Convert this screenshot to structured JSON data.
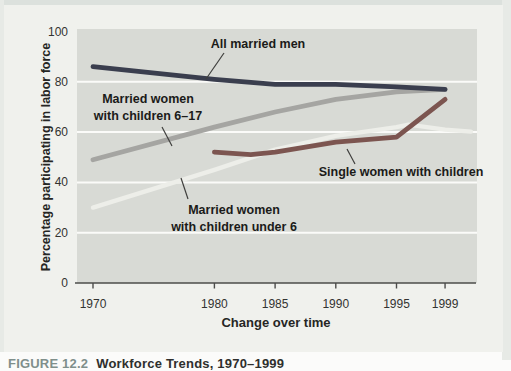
{
  "figure": {
    "caption_label": "FIGURE 12.2",
    "caption_title": "Workforce Trends, 1970–1999"
  },
  "colors": {
    "page": "#fbfbfa",
    "top_strip": "#dce1dd",
    "side_strip": "#e7eae6",
    "panel": "#f0f1ed",
    "plot_bg": "#d8dad5",
    "gridline": "#fbfbf9",
    "axis": "#4c4c4a",
    "tick_text": "#333331",
    "axis_title_text": "#262624",
    "annotation_text": "#1b1b19",
    "leader_line": "#3f3f3d",
    "caption_label": "#7f8f8b",
    "caption_title": "#2f2f2d"
  },
  "chart_data": {
    "type": "line",
    "title": "",
    "xlabel": "Change over time",
    "ylabel": "Percentage participating in labor force",
    "x_ticks": [
      1970,
      1980,
      1985,
      1990,
      1995,
      1999
    ],
    "y_ticks": [
      0,
      20,
      40,
      60,
      80,
      100
    ],
    "xlim": [
      1970,
      2001
    ],
    "ylim": [
      0,
      100
    ],
    "grid": "horizontal",
    "legend_position": "inline-annotations",
    "series": [
      {
        "name": "All married men",
        "color": "#3a3e4e",
        "x": [
          1970,
          1980,
          1985,
          1990,
          1995,
          1999
        ],
        "values": [
          86,
          81,
          79,
          79,
          78,
          77
        ]
      },
      {
        "name": "Married women with children 6–17",
        "color": "#a5a5a2",
        "x": [
          1970,
          1980,
          1985,
          1990,
          1995,
          1999
        ],
        "values": [
          49,
          62,
          68,
          73,
          76,
          77
        ]
      },
      {
        "name": "Married women with children under 6",
        "color": "#edeee9",
        "x": [
          1970,
          1980,
          1985,
          1990,
          1995,
          1996,
          1999
        ],
        "values": [
          30,
          45,
          53,
          58.5,
          62,
          63,
          61
        ]
      },
      {
        "name": "Single women with children",
        "color": "#7c5550",
        "x": [
          1980,
          1983,
          1985,
          1990,
          1995,
          1999
        ],
        "values": [
          52,
          51,
          52,
          56,
          58,
          73
        ]
      }
    ],
    "annotations": [
      {
        "id": "men",
        "lines": [
          "All married men"
        ]
      },
      {
        "id": "mw617",
        "lines": [
          "Married women",
          "with children 6–17"
        ]
      },
      {
        "id": "mwu6",
        "lines": [
          "Married women",
          "with children under 6"
        ]
      },
      {
        "id": "single",
        "lines": [
          "Single women with children"
        ]
      }
    ]
  }
}
